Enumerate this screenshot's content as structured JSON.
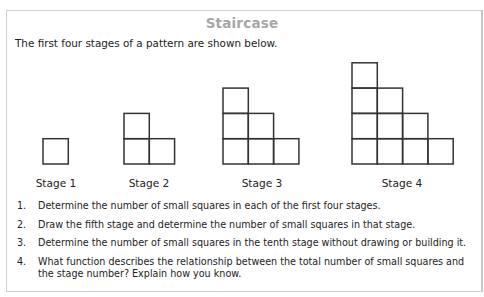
{
  "document": {
    "title": "Staircase",
    "intro": "The first four stages of a pattern are shown below.",
    "stages": [
      {
        "label": "Stage 1",
        "columns": [
          1
        ],
        "square_count": 1
      },
      {
        "label": "Stage 2",
        "columns": [
          2,
          1
        ],
        "square_count": 3
      },
      {
        "label": "Stage 3",
        "columns": [
          3,
          2,
          1
        ],
        "square_count": 6
      },
      {
        "label": "Stage 4",
        "columns": [
          4,
          3,
          2,
          1
        ],
        "square_count": 10
      }
    ],
    "questions": [
      {
        "number": "1.",
        "text": "Determine the number of small squares in each of the first four stages."
      },
      {
        "number": "2.",
        "text": "Draw the fifth stage and determine the number of small squares in that stage."
      },
      {
        "number": "3.",
        "text": "Determine the number of small squares in the tenth stage without drawing or building it."
      },
      {
        "number": "4.",
        "text": "What function describes the relationship between the total number of small squares and the stage number? Explain how you know."
      }
    ]
  },
  "colors": {
    "title": "#a6a6a6",
    "text": "#222222",
    "square_stroke": "#333333",
    "frame_border": "#cfcfcf"
  }
}
